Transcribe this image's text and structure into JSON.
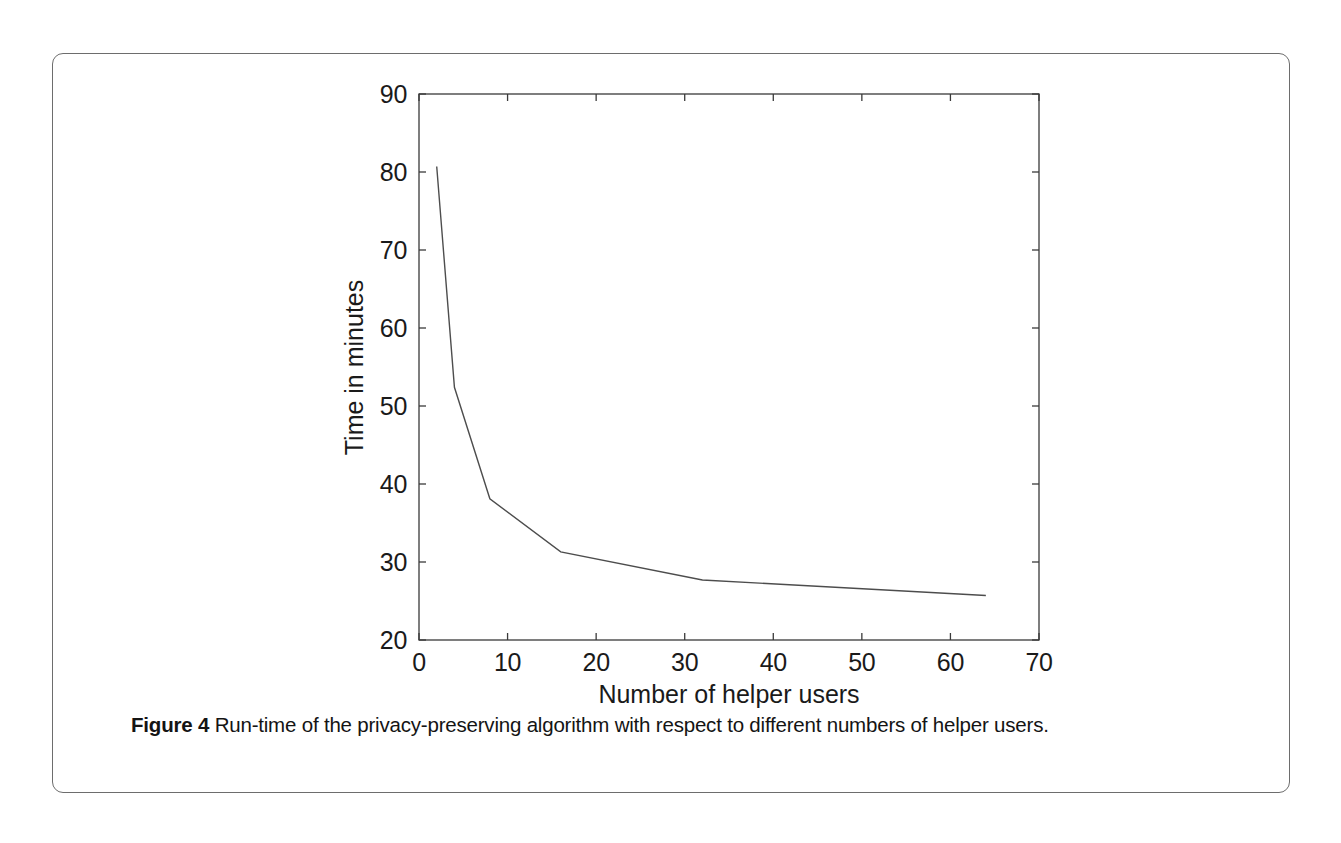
{
  "figure": {
    "caption_label": "Figure 4",
    "caption_text": "Run-time of the privacy-preserving algorithm with respect to different numbers of helper users."
  },
  "chart_data": {
    "type": "line",
    "title": "",
    "subtitle": "",
    "xlabel": "Number of helper users",
    "ylabel": "Time in minutes",
    "xlim": [
      0,
      70
    ],
    "ylim": [
      20,
      90
    ],
    "xticks": [
      0,
      10,
      20,
      30,
      40,
      50,
      60,
      70
    ],
    "xtick_labels": [
      "0",
      "10",
      "20",
      "30",
      "40",
      "50",
      "60",
      "70"
    ],
    "yticks": [
      20,
      30,
      40,
      50,
      60,
      70,
      80,
      90
    ],
    "ytick_labels": [
      "20",
      "30",
      "40",
      "50",
      "60",
      "70",
      "80",
      "90"
    ],
    "grid": false,
    "legend": "none",
    "line_color": "#4d4d4d",
    "line_width": 1.4,
    "series": [
      {
        "name": "Run-time",
        "x": [
          2,
          4,
          8,
          16,
          32,
          64
        ],
        "values": [
          80.7,
          52.4,
          38.1,
          31.3,
          27.7,
          25.7
        ]
      }
    ]
  }
}
